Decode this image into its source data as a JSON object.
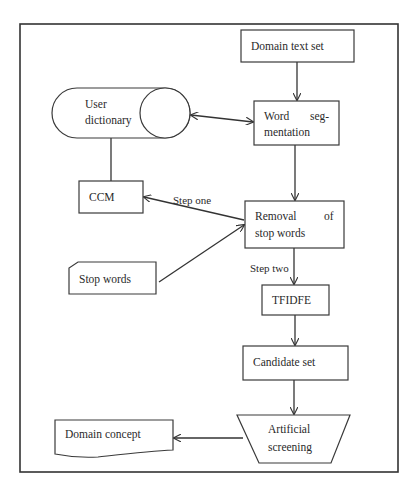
{
  "diagram": {
    "type": "flowchart",
    "nodes": {
      "domain_text_set": {
        "label": "Domain text set",
        "shape": "rectangle"
      },
      "user_dictionary": {
        "label_line1": "User",
        "label_line2": "dictionary",
        "shape": "cylinder-horizontal"
      },
      "word_segmentation": {
        "label_line1a": "Word",
        "label_line1b": "seg-",
        "label_line2": "mentation",
        "shape": "rectangle"
      },
      "ccm": {
        "label": "CCM",
        "shape": "rectangle"
      },
      "removal_stop_words": {
        "label_line1a": "Removal",
        "label_line1b": "of",
        "label_line2": "stop words",
        "shape": "rectangle"
      },
      "stop_words": {
        "label": "Stop words",
        "shape": "card"
      },
      "tfidfe": {
        "label": "TFIDFE",
        "shape": "rectangle"
      },
      "candidate_set": {
        "label": "Candidate set",
        "shape": "rectangle"
      },
      "artificial_screening": {
        "label_line1": "Artificial",
        "label_line2": "screening",
        "shape": "trapezoid"
      },
      "domain_concept": {
        "label": "Domain concept",
        "shape": "document"
      }
    },
    "edges": [
      {
        "from": "domain_text_set",
        "to": "word_segmentation",
        "label": ""
      },
      {
        "from": "user_dictionary",
        "to": "word_segmentation",
        "label": "",
        "bidirectional": true
      },
      {
        "from": "user_dictionary",
        "to": "ccm",
        "label": "",
        "arrow": false
      },
      {
        "from": "word_segmentation",
        "to": "removal_stop_words",
        "label": ""
      },
      {
        "from": "removal_stop_words",
        "to": "ccm",
        "label": "Step one"
      },
      {
        "from": "stop_words",
        "to": "removal_stop_words",
        "label": ""
      },
      {
        "from": "removal_stop_words",
        "to": "tfidfe",
        "label": "Step two"
      },
      {
        "from": "tfidfe",
        "to": "candidate_set",
        "label": ""
      },
      {
        "from": "candidate_set",
        "to": "artificial_screening",
        "label": ""
      },
      {
        "from": "artificial_screening",
        "to": "domain_concept",
        "label": ""
      }
    ],
    "edge_labels": {
      "step_one": "Step one",
      "step_two": "Step two"
    },
    "colors": {
      "stroke": "#333333",
      "background": "#ffffff",
      "text": "#2a2a2a"
    }
  }
}
